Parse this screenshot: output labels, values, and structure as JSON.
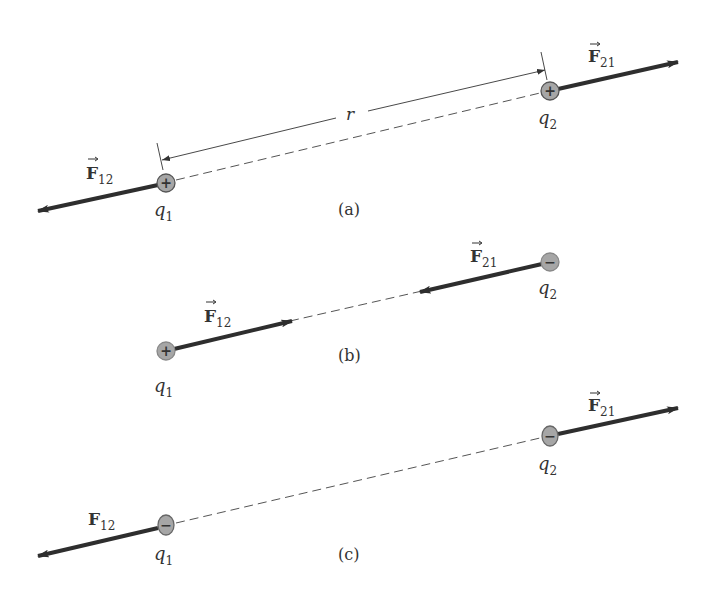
{
  "colors": {
    "background": "#ffffff",
    "arrow": "#2e2e2e",
    "charge_fill": "#a6a6a6",
    "charge_stroke": "#555555",
    "dashed_line": "#555555",
    "text": "#333333"
  },
  "panels": [
    {
      "label": "(a)",
      "q1": {
        "name": "q",
        "sub": "1",
        "sign": "+"
      },
      "q2": {
        "name": "q",
        "sub": "2",
        "sign": "+"
      },
      "F12": {
        "name": "F",
        "sub": "12",
        "direction": "away from q2"
      },
      "F21": {
        "name": "F",
        "sub": "21",
        "direction": "away from q1"
      },
      "distance_label": "r"
    },
    {
      "label": "(b)",
      "q1": {
        "name": "q",
        "sub": "1",
        "sign": "+"
      },
      "q2": {
        "name": "q",
        "sub": "2",
        "sign": "−"
      },
      "F12": {
        "name": "F",
        "sub": "12",
        "direction": "toward q2"
      },
      "F21": {
        "name": "F",
        "sub": "21",
        "direction": "toward q1"
      }
    },
    {
      "label": "(c)",
      "q1": {
        "name": "q",
        "sub": "1",
        "sign": "−"
      },
      "q2": {
        "name": "q",
        "sub": "2",
        "sign": "−"
      },
      "F12": {
        "name": "F",
        "sub": "12",
        "direction": "away from q2"
      },
      "F21": {
        "name": "F",
        "sub": "21",
        "direction": "away from q1"
      }
    }
  ]
}
